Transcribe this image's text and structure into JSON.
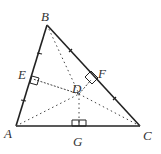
{
  "diagram": {
    "type": "geometry",
    "points": {
      "A": {
        "label": "A",
        "x": 16,
        "y": 126
      },
      "B": {
        "label": "B",
        "x": 47,
        "y": 25
      },
      "C": {
        "label": "C",
        "x": 140,
        "y": 126
      },
      "D": {
        "label": "D",
        "x": 79,
        "y": 94
      },
      "E": {
        "label": "E",
        "x": 31,
        "y": 75
      },
      "F": {
        "label": "F",
        "x": 92,
        "y": 78
      },
      "G": {
        "label": "G",
        "x": 78,
        "y": 126
      }
    },
    "labels": {
      "A": "A",
      "B": "B",
      "C": "C",
      "D": "D",
      "E": "E",
      "F": "F",
      "G": "G"
    },
    "colors": {
      "line": "#222222",
      "text": "#333333",
      "background": "#ffffff"
    }
  }
}
